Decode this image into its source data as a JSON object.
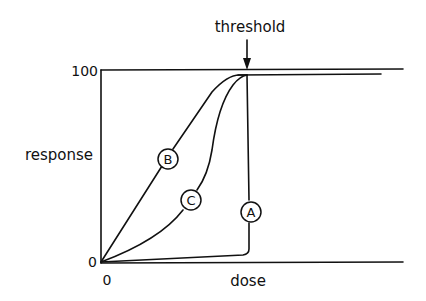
{
  "diagram": {
    "annotation": {
      "threshold_label": "threshold"
    },
    "axes": {
      "y_label": "response",
      "x_label": "dose",
      "y_top_tick": "100",
      "y_origin_tick": "0",
      "x_origin_tick": "0"
    },
    "curves": [
      {
        "id": "A",
        "label": "A",
        "shape": "flat near zero until threshold, then vertical rise to 100"
      },
      {
        "id": "B",
        "label": "B",
        "shape": "approximately linear rise from origin, saturating at 100 at threshold"
      },
      {
        "id": "C",
        "label": "C",
        "shape": "concave-up rise from origin, saturating at 100 at threshold"
      }
    ],
    "colors": {
      "ink": "#111111",
      "background": "#ffffff"
    }
  }
}
